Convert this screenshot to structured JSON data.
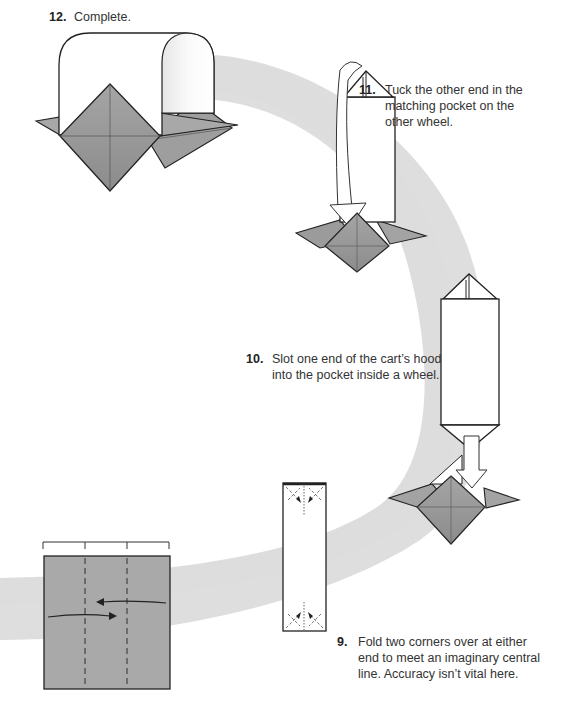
{
  "colors": {
    "background": "#ffffff",
    "path_band": "#dcdcdc",
    "paper_gray": "#a9a9a9",
    "paper_gray_dark": "#8f8f8f",
    "paper_white": "#ffffff",
    "outline": "#222222"
  },
  "steps": [
    {
      "number": "12.",
      "text": "Complete.",
      "diagram": "finished-cart"
    },
    {
      "number": "11.",
      "text": "Tuck the other end in the matching pocket on the other wheel.",
      "lines": [
        "Tuck the other end in the",
        "matching pocket on the",
        "other wheel."
      ],
      "diagram": "hood-tucked-into-second-wheel"
    },
    {
      "number": "10.",
      "text": "Slot one end of the cart's hood into the pocket inside a wheel.",
      "lines": [
        "Slot one end of the cart’s hood",
        "into the pocket inside a wheel."
      ],
      "diagram": "hood-slotted-into-wheel"
    },
    {
      "number": "9.",
      "text": "Fold two corners over at either end to meet an imaginary central line. Accuracy isn't vital here.",
      "lines": [
        "Fold two corners over at either",
        "end to meet an imaginary central",
        "line. Accuracy isn’t vital here."
      ],
      "diagram": "folded-strip-with-corner-folds"
    }
  ],
  "diagrams": {
    "square_with_thirds": {
      "description": "Gray square divided into thirds with dashed valley fold lines and arrows folding both sides to center",
      "divisions": 3
    }
  }
}
